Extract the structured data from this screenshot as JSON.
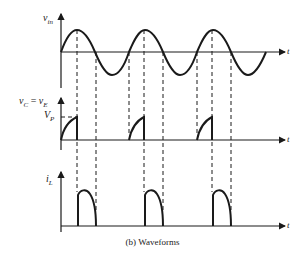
{
  "figure": {
    "caption": "(b) Waveforms",
    "colors": {
      "ink": "#1a1a1a",
      "background": "#ffffff"
    }
  },
  "plots": [
    {
      "id": "vin",
      "ylabel_main": "v",
      "ylabel_sub": "in",
      "xlabel": "t",
      "description": "Sinusoidal input voltage, 3 cycles"
    },
    {
      "id": "vc",
      "ylabel_left_main": "v",
      "ylabel_left_sub": "C",
      "ylabel_eq": " = ",
      "ylabel_right_main": "v",
      "ylabel_right_sub": "E",
      "level_label_main": "V",
      "level_label_sub": "P",
      "xlabel": "t",
      "description": "Capacitor/emitter voltage ramps up to Vp then drops to zero at the sine peak"
    },
    {
      "id": "il",
      "ylabel_main": "i",
      "ylabel_sub": "L",
      "xlabel": "t",
      "description": "Load current pulses between sine peak and next zero crossing"
    }
  ]
}
